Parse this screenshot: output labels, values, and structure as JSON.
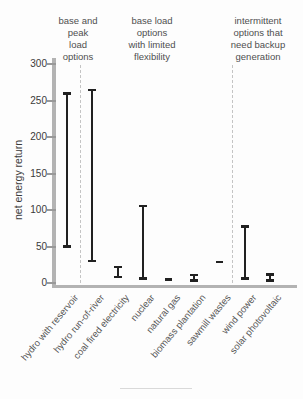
{
  "chart_data": {
    "type": "bar",
    "subtype": "floating-range-bars",
    "title": "",
    "ylabel": "net energy return",
    "xlabel": "",
    "ylim": [
      0,
      300
    ],
    "yticks": [
      0,
      50,
      100,
      150,
      200,
      250,
      300
    ],
    "grid": false,
    "legend": "none",
    "categories": [
      "hydro with reservoir",
      "hydro run-of-river",
      "coal fired electricity",
      "nuclear",
      "natural gas",
      "biomass plantation",
      "sawmill wastes",
      "wind power",
      "solar photovoltaic"
    ],
    "series": [
      {
        "name": "net energy return range (min-max)",
        "ranges": [
          [
            50,
            260
          ],
          [
            30,
            265
          ],
          [
            8,
            22
          ],
          [
            6,
            106
          ],
          [
            4,
            6
          ],
          [
            3,
            11
          ],
          [
            27,
            30
          ],
          [
            6,
            78
          ],
          [
            3,
            12
          ]
        ]
      }
    ],
    "group_annotations": [
      {
        "label": "base and peak load options",
        "lines": [
          "base and",
          "peak",
          "load",
          "options"
        ],
        "categories": [
          "hydro with reservoir"
        ]
      },
      {
        "label": "base load options with limited flexibility",
        "lines": [
          "base load",
          "options",
          "with limited",
          "flexibility"
        ],
        "categories": [
          "hydro run-of-river",
          "coal fired electricity",
          "nuclear",
          "natural gas",
          "biomass plantation",
          "sawmill wastes"
        ]
      },
      {
        "label": "intermittent options that need backup generation",
        "lines": [
          "intermittent",
          "options that",
          "need backup",
          "generation"
        ],
        "categories": [
          "wind power",
          "solar photovoltaic"
        ]
      }
    ],
    "separators_after_category_index": [
      0,
      6
    ],
    "colors": {
      "bar": "#212121",
      "axis": "#b3b3b3",
      "tick": "#999999",
      "dashed_separator": "#c4c4c4",
      "tick_text": "#3a3a3a",
      "category_text": "#555555",
      "group_text": "#4f4f4f",
      "background": "#fdfdfd"
    }
  }
}
